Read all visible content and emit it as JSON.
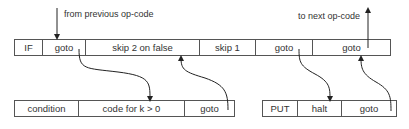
{
  "top_row": [
    "IF",
    "goto",
    "skip 2 on false",
    "skip 1",
    "goto",
    "goto"
  ],
  "bottom_left_row": [
    "condition",
    "code for k > 0",
    "goto"
  ],
  "bottom_right_row": [
    "PUT",
    "halt",
    "goto"
  ],
  "labels": {
    "from_previous": "from previous op-code",
    "to_next": "to next op-code"
  },
  "arrows": [
    {
      "from": "from previous op-code",
      "to": "top goto (IF)"
    },
    {
      "from": "top goto (IF)",
      "to": "code for k > 0"
    },
    {
      "from": "bottom-left goto",
      "to": "skip 2 on false"
    },
    {
      "from": "top goto (skip 1)",
      "to": "halt"
    },
    {
      "from": "bottom-right goto",
      "to": "last top goto"
    },
    {
      "from": "last top goto",
      "to": "to next op-code"
    }
  ]
}
